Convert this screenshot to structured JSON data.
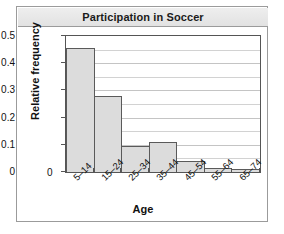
{
  "figure": {
    "title": "Participation in Soccer"
  },
  "chart_data": {
    "type": "bar",
    "title": "Participation in Soccer",
    "xlabel": "Age",
    "ylabel": "Relative frequency",
    "categories": [
      "5–14",
      "15–24",
      "25–34",
      "35–44",
      "45–54",
      "55–64",
      "65–74"
    ],
    "values": [
      0.455,
      0.28,
      0.095,
      0.11,
      0.04,
      0.015,
      0.01
    ],
    "ylim": [
      0,
      0.5
    ],
    "yticks": [
      0,
      0.1,
      0.2,
      0.3,
      0.4,
      0.5
    ],
    "ytick_labels": [
      "0",
      "0.1",
      "0.2",
      "0.3",
      "0.4",
      "0.5"
    ],
    "minor_tick_step": 0.05,
    "grid": true,
    "grid_axis": "y",
    "legend": false,
    "bar_fill_color": "#dcdcdc",
    "bar_edge_color": "#5a5a5a",
    "gridline_color": "#d2d2d2"
  }
}
